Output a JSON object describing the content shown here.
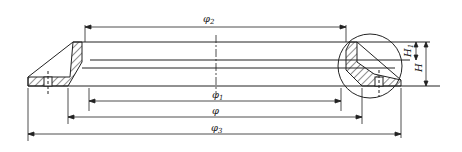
{
  "drawing": {
    "type": "engineering cross-section of ring gasket",
    "line_color": "#222222",
    "background": "#ffffff",
    "dimensions": {
      "phi2": {
        "symbol": "φ",
        "sub": "2"
      },
      "phi1": {
        "symbol": "φ",
        "sub": "1"
      },
      "phi": {
        "symbol": "φ",
        "sub": ""
      },
      "phi3": {
        "symbol": "φ",
        "sub": "3"
      },
      "H1": {
        "symbol": "H",
        "sub": "1"
      },
      "H": {
        "symbol": "H",
        "sub": ""
      }
    }
  }
}
